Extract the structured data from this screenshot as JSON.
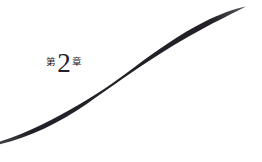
{
  "page": {
    "type": "book-chapter-divider",
    "background_color": "#ffffff",
    "ink_color": "#232127"
  },
  "heading": {
    "prefix": "第",
    "number": "2",
    "suffix": "章",
    "full_text": "第2章"
  },
  "ornament": {
    "name": "brush-stroke-swash",
    "color": "#232127",
    "description": "tapered S-curve brush stroke sweeping bottom-left to top-right",
    "start_point": "0,141",
    "end_point": "246,7",
    "max_thickness_px": 9
  }
}
